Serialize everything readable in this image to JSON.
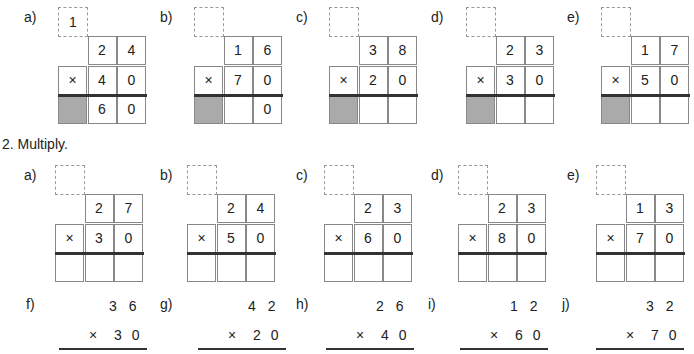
{
  "section1": {
    "problems": [
      {
        "label": "a)",
        "carry": "1",
        "top": [
          "2",
          "4"
        ],
        "mult": [
          "×",
          "4",
          "0"
        ],
        "result": [
          "",
          "6",
          "0"
        ],
        "shade": true
      },
      {
        "label": "b)",
        "carry": "",
        "top": [
          "1",
          "6"
        ],
        "mult": [
          "×",
          "7",
          "0"
        ],
        "result": [
          "",
          "",
          "0"
        ],
        "shade": true
      },
      {
        "label": "c)",
        "carry": "",
        "top": [
          "3",
          "8"
        ],
        "mult": [
          "×",
          "2",
          "0"
        ],
        "result": [
          "",
          "",
          ""
        ],
        "shade": true
      },
      {
        "label": "d)",
        "carry": "",
        "top": [
          "2",
          "3"
        ],
        "mult": [
          "×",
          "3",
          "0"
        ],
        "result": [
          "",
          "",
          ""
        ],
        "shade": true
      },
      {
        "label": "e)",
        "carry": "",
        "top": [
          "1",
          "7"
        ],
        "mult": [
          "×",
          "5",
          "0"
        ],
        "result": [
          "",
          "",
          ""
        ],
        "shade": true
      }
    ]
  },
  "section2": {
    "title": "2.  Multiply.",
    "problems": [
      {
        "label": "a)",
        "carry": "",
        "top": [
          "2",
          "7"
        ],
        "mult": [
          "×",
          "3",
          "0"
        ],
        "result": [
          "",
          "",
          ""
        ],
        "shade": false
      },
      {
        "label": "b)",
        "carry": "",
        "top": [
          "2",
          "4"
        ],
        "mult": [
          "×",
          "5",
          "0"
        ],
        "result": [
          "",
          "",
          ""
        ],
        "shade": false
      },
      {
        "label": "c)",
        "carry": "",
        "top": [
          "2",
          "3"
        ],
        "mult": [
          "×",
          "6",
          "0"
        ],
        "result": [
          "",
          "",
          ""
        ],
        "shade": false
      },
      {
        "label": "d)",
        "carry": "",
        "top": [
          "2",
          "3"
        ],
        "mult": [
          "×",
          "8",
          "0"
        ],
        "result": [
          "",
          "",
          ""
        ],
        "shade": false
      },
      {
        "label": "e)",
        "carry": "",
        "top": [
          "1",
          "3"
        ],
        "mult": [
          "×",
          "7",
          "0"
        ],
        "result": [
          "",
          "",
          ""
        ],
        "shade": false
      }
    ],
    "vertical": [
      {
        "label": "f)",
        "top": "3 6",
        "bottom": "×  3 0"
      },
      {
        "label": "g)",
        "top": "4 2",
        "bottom": "×  2 0"
      },
      {
        "label": "h)",
        "top": "2 6",
        "bottom": "×  4 0"
      },
      {
        "label": "i)",
        "top": "1 2",
        "bottom": "×  6 0"
      },
      {
        "label": "j)",
        "top": "3 2",
        "bottom": "×  7 0"
      }
    ]
  }
}
